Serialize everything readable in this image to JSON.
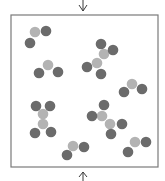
{
  "diagram": {
    "title": "",
    "colors": {
      "dark_atom": "#6b6b6b",
      "light_atom": "#b3b3b3",
      "border": "#7a7a7a",
      "arrow": "#3a3a3a"
    },
    "arrows": [
      {
        "name": "top-arrow",
        "direction": "down"
      },
      {
        "name": "bottom-arrow",
        "direction": "up"
      }
    ],
    "molecules": [
      {
        "name": "molecule-1",
        "atoms": [
          "light",
          "dark",
          "dark"
        ]
      },
      {
        "name": "molecule-2",
        "atoms": [
          "light",
          "dark",
          "dark"
        ]
      },
      {
        "name": "molecule-3",
        "atoms": [
          "dark",
          "dark",
          "light",
          "light",
          "dark",
          "dark"
        ]
      },
      {
        "name": "molecule-4",
        "atoms": [
          "light",
          "dark",
          "dark"
        ]
      },
      {
        "name": "molecule-5",
        "atoms": [
          "dark",
          "dark",
          "light",
          "light",
          "dark",
          "dark"
        ]
      },
      {
        "name": "molecule-6",
        "atoms": [
          "dark",
          "dark",
          "light",
          "light",
          "dark",
          "dark"
        ]
      },
      {
        "name": "molecule-7",
        "atoms": [
          "light",
          "dark",
          "dark"
        ]
      },
      {
        "name": "molecule-8",
        "atoms": [
          "light",
          "dark",
          "dark"
        ]
      }
    ]
  }
}
